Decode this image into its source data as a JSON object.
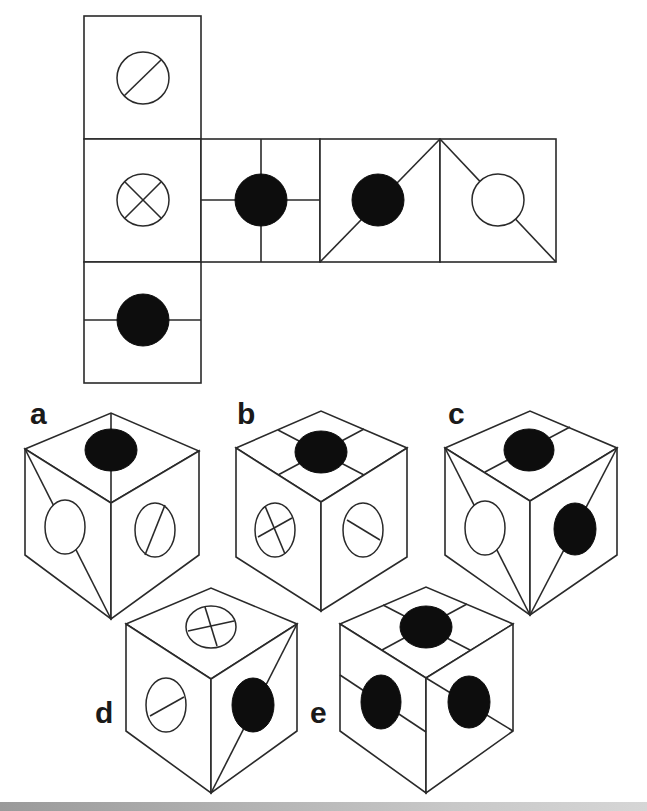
{
  "puzzle": {
    "type": "cube-net-folding",
    "net": {
      "layout": "T-shape: vertical column of 3 squares on the left, 3 additional squares extending right from the middle square",
      "cells": [
        {
          "id": "top",
          "symbol": "white circle with single diagonal line (bottom-left to top-right)"
        },
        {
          "id": "middle-left",
          "symbol": "white circle with X cross"
        },
        {
          "id": "bottom",
          "symbol": "black circle on horizontal line"
        },
        {
          "id": "middle-2",
          "symbol": "black circle on horizontal and vertical cross lines"
        },
        {
          "id": "middle-3",
          "symbol": "black circle on diagonal line from bottom-left to top-right corner"
        },
        {
          "id": "middle-4",
          "symbol": "white circle with lines from top-left and bottom-right corners"
        }
      ]
    },
    "options": [
      {
        "label": "a",
        "top": "black circle",
        "left": "white circle with diagonal corner lines",
        "right": "white circle with diagonal line"
      },
      {
        "label": "b",
        "top": "black circle on cross lines",
        "left": "white circle with X cross",
        "right": "white circle with single line"
      },
      {
        "label": "c",
        "top": "black circle on line",
        "left": "white circle with diagonal corner lines",
        "right": "black circle with diagonal corner lines"
      },
      {
        "label": "d",
        "top": "white circle with X cross",
        "left": "white circle with single line",
        "right": "black circle on diagonal corner line"
      },
      {
        "label": "e",
        "top": "black circle on cross lines",
        "left": "black circle on line",
        "right": "black circle on line"
      }
    ]
  },
  "labels": {
    "a": "a",
    "b": "b",
    "c": "c",
    "d": "d",
    "e": "e"
  },
  "colors": {
    "line": "#2a2a2a",
    "fill_black": "#0d0d0d",
    "background": "#ffffff",
    "bottom_bar": "#b0b0b0"
  }
}
